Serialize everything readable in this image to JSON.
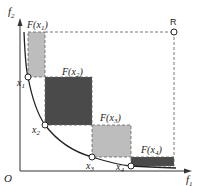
{
  "diagram": {
    "axes": {
      "x_label": "f",
      "x_sub": "1",
      "y_label": "f",
      "y_sub": "2",
      "origin_label": "O"
    },
    "reference_point": {
      "label": "R"
    },
    "points": [
      {
        "label": "x",
        "sub": "1",
        "region_label": "F(x",
        "region_sub": "1",
        "region_close": ")"
      },
      {
        "label": "x",
        "sub": "2",
        "region_label": "F(x",
        "region_sub": "2",
        "region_close": ")"
      },
      {
        "label": "x",
        "sub": "3",
        "region_label": "F(x",
        "region_sub": "3",
        "region_close": ")"
      },
      {
        "label": "x",
        "sub": "4",
        "region_label": "F(x",
        "region_sub": "4",
        "region_close": ")"
      }
    ],
    "colors": {
      "light_region": "#bdbdbd",
      "dark_region": "#4a4a4a",
      "curve": "#222222",
      "dash": "#555555"
    }
  }
}
